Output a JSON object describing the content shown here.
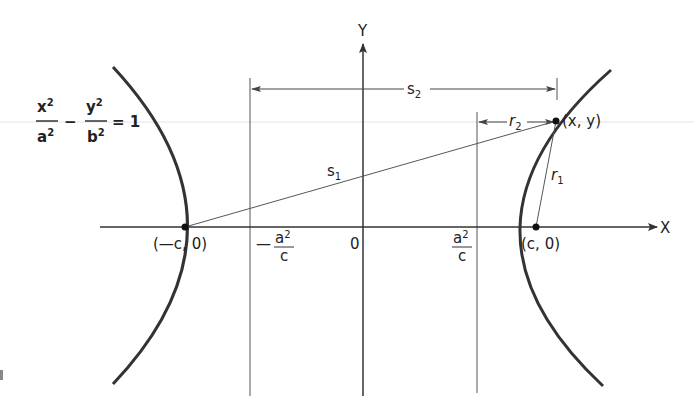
{
  "diagram": {
    "type": "hyperbola-geometry",
    "equation": {
      "x_num": "x",
      "x_exp": "2",
      "a_den": "a",
      "a_exp": "2",
      "minus": "−",
      "y_num": "y",
      "y_exp": "2",
      "b_den": "b",
      "b_exp": "2",
      "rhs": "= 1"
    },
    "axes": {
      "x_label": "X",
      "y_label": "Y",
      "origin_label": "0"
    },
    "points": {
      "left_focus": "(—c, 0)",
      "right_focus": "(c, 0)",
      "point_on_curve": "(x, y)"
    },
    "directrix_labels": {
      "left_minus": "—",
      "left_num": "a",
      "left_num_exp": "2",
      "left_den": "c",
      "right_num": "a",
      "right_num_exp": "2",
      "right_den": "c"
    },
    "distances": {
      "s1_base": "s",
      "s1_sub": "1",
      "s2_base": "s",
      "s2_sub": "2",
      "r1_base": "r",
      "r1_sub": "1",
      "r2_base": "r",
      "r2_sub": "2"
    },
    "colors": {
      "curve": "#333333",
      "axis": "#333333",
      "guide": "#555555",
      "faint_rule": "#dddddd"
    }
  }
}
